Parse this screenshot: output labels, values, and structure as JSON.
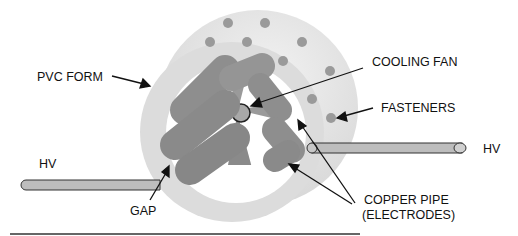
{
  "diagram": {
    "labels": {
      "pvc_form": "PVC FORM",
      "cooling_fan": "COOLING FAN",
      "fasteners": "FASTENERS",
      "hv_left": "HV",
      "hv_right": "HV",
      "gap": "GAP",
      "copper_pipe_line1": "COPPER PIPE",
      "copper_pipe_line2": "(ELECTRODES)"
    },
    "colors": {
      "pvc_form": "#e6e6e6",
      "pvc_inner_rim": "#d2d2d2",
      "electrode": "#8f8f8f",
      "fastener": "#9a9a9a",
      "hv_rod": "#b8b8b8",
      "outline": "#222222"
    }
  }
}
